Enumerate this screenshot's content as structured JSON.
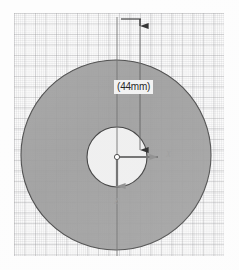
{
  "drawing": {
    "title": "circular-part-section-view",
    "annotations": {
      "diameter_label": "(44mm)",
      "x_axis_label": "X",
      "z_axis_label": "Z"
    },
    "geometry": {
      "outer_circle": {
        "cx": 116,
        "cy": 155,
        "r": 95,
        "fill": "#9a9a9a",
        "stroke": "#4a4a4a"
      },
      "inner_circle": {
        "cx": 117,
        "cy": 157,
        "r": 30,
        "fill": "#f0f0f0",
        "stroke": "#3f3f3f"
      },
      "origin": {
        "x": 117,
        "y": 157
      }
    },
    "dimension": {
      "value": "44mm",
      "extension_line_left_x": 117,
      "extension_line_right_x": 140,
      "top_tick_y": 19,
      "arrow_tip_y": 150
    },
    "colors": {
      "body_fill": "#9a9a9a",
      "hole_fill": "#f0f0f0",
      "outline": "#454545",
      "grid_minor": "#c9c9cd",
      "grid_major": "#9b9b9f",
      "annotation_text": "#1a1a1a",
      "axis_text": "#9a9a9a",
      "paper": "#fbfbfb"
    }
  }
}
